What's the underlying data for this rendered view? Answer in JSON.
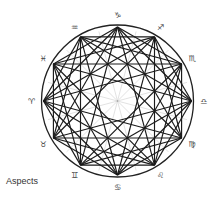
{
  "diagram": {
    "caption": "Aspects",
    "center": [
      117.5,
      101
    ],
    "outer_radius": 76,
    "point_radius": 74,
    "label_radius": 86,
    "colors": {
      "circle": "#222222",
      "aspect_line": "#1a1a1a",
      "spoke": "#d6d6d6",
      "label": "#444444"
    },
    "signs": [
      {
        "name": "Aries",
        "glyph": "♈",
        "angle": 180
      },
      {
        "name": "Taurus",
        "glyph": "♉",
        "angle": 210
      },
      {
        "name": "Gemini",
        "glyph": "♊",
        "angle": 240
      },
      {
        "name": "Cancer",
        "glyph": "♋",
        "angle": 270
      },
      {
        "name": "Leo",
        "glyph": "♌",
        "angle": 300
      },
      {
        "name": "Virgo",
        "glyph": "♍",
        "angle": 330
      },
      {
        "name": "Libra",
        "glyph": "♎",
        "angle": 0
      },
      {
        "name": "Scorpio",
        "glyph": "♏",
        "angle": 30
      },
      {
        "name": "Sagittarius",
        "glyph": "♐",
        "angle": 60
      },
      {
        "name": "Capricorn",
        "glyph": "♑",
        "angle": 90
      },
      {
        "name": "Aquarius",
        "glyph": "♒",
        "angle": 120
      },
      {
        "name": "Pisces",
        "glyph": "♓",
        "angle": 150
      }
    ],
    "aspects_steps": [
      {
        "name": "sextile",
        "degrees": 60,
        "step": 2
      },
      {
        "name": "square",
        "degrees": 90,
        "step": 3
      },
      {
        "name": "trine",
        "degrees": 120,
        "step": 4
      },
      {
        "name": "quincunx",
        "degrees": 150,
        "step": 5
      }
    ]
  }
}
